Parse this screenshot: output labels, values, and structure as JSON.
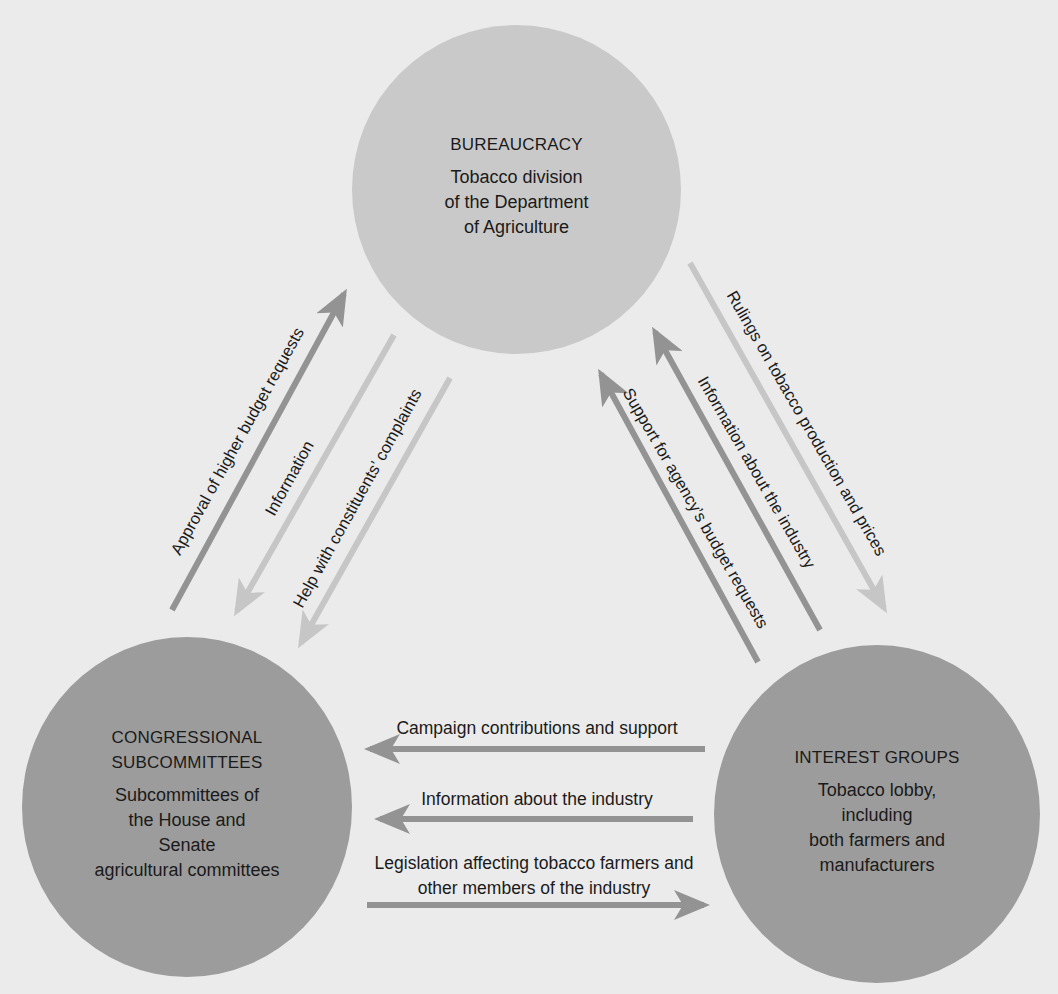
{
  "diagram": {
    "type": "iron-triangle",
    "colors": {
      "background": "#ebebeb",
      "bureaucracy_fill": "#c9c9c9",
      "bottom_node_fill": "#9c9c9c",
      "arrow_dark": "#939393",
      "arrow_light": "#c6c6c6"
    },
    "nodes": {
      "bureaucracy": {
        "title": "BUREAUCRACY",
        "lines": [
          "Tobacco division",
          "of the Department",
          "of Agriculture"
        ]
      },
      "congress": {
        "title_lines": [
          "CONGRESSIONAL",
          "SUBCOMMITTEES"
        ],
        "lines": [
          "Subcommittees of",
          "the House and",
          "Senate",
          "agricultural committees"
        ]
      },
      "interest_groups": {
        "title": "INTEREST GROUPS",
        "lines": [
          "Tobacco lobby,",
          "including",
          "both farmers and",
          "manufacturers"
        ]
      }
    },
    "edges": {
      "congress_to_bureaucracy": "Approval of higher budget requests",
      "bureaucracy_to_congress_info": "Information",
      "bureaucracy_to_congress_help": "Help with constituents’ complaints",
      "bureaucracy_to_interest": "Rulings on tobacco production and prices",
      "interest_to_bureaucracy_info": "Information about the industry",
      "interest_to_bureaucracy_support": "Support for agency’s budget requests",
      "interest_to_congress_campaign": "Campaign contributions and support",
      "interest_to_congress_info": "Information about the industry",
      "congress_to_interest_legislation_lines": [
        "Legislation affecting tobacco farmers and",
        "other members of the industry"
      ]
    }
  }
}
